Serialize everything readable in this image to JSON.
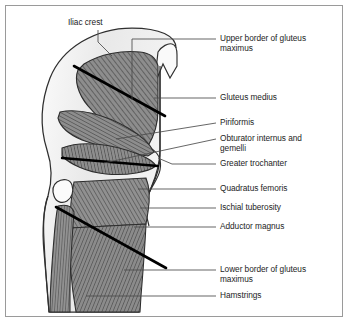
{
  "figure": {
    "type": "anatomical-diagram",
    "view": "posterior view of right hip and thigh",
    "background_color": "#ffffff",
    "border_color": "#9a9a9a",
    "muscle_fill": "#8d8d8d",
    "muscle_hatch": "#3a3a3a",
    "body_fill": "#ececec",
    "outline_color": "#2b2b2b",
    "label_color": "#1d1d1d",
    "leader_color": "#3b3b3b",
    "marker_color": "#000000"
  },
  "labels": {
    "iliac_crest": "Iliac crest",
    "upper_border_gluteus_maximus": "Upper border of gluteus\nmaximus",
    "gluteus_medius": "Gluteus medius",
    "piriformis": "Piriformis",
    "obturator_internus_gemelli": "Obturator internus and\ngemelli",
    "greater_trochanter": "Greater trochanter",
    "quadratus_femoris": "Quadratus femoris",
    "ischial_tuberosity": "Ischial tuberosity",
    "adductor_magnus": "Adductor magnus",
    "lower_border_gluteus_maximus": "Lower border of gluteus\nmaximus",
    "hamstrings": "Hamstrings"
  },
  "structures": [
    {
      "name": "iliac-crest",
      "kind": "bony-landmark",
      "marker": "thick-black-line"
    },
    {
      "name": "upper-border-gluteus-maximus",
      "kind": "muscle-border"
    },
    {
      "name": "gluteus-medius",
      "kind": "muscle",
      "shape": "fan"
    },
    {
      "name": "piriformis",
      "kind": "muscle",
      "shape": "wedge"
    },
    {
      "name": "obturator-internus-and-gemelli",
      "kind": "muscle",
      "shape": "lens"
    },
    {
      "name": "greater-trochanter",
      "kind": "bony-landmark"
    },
    {
      "name": "quadratus-femoris",
      "kind": "muscle",
      "shape": "quadrilateral"
    },
    {
      "name": "ischial-tuberosity",
      "kind": "bony-landmark"
    },
    {
      "name": "adductor-magnus",
      "kind": "muscle"
    },
    {
      "name": "lower-border-gluteus-maximus",
      "kind": "muscle-border",
      "marker": "thick-black-line"
    },
    {
      "name": "hamstrings",
      "kind": "muscle-group"
    }
  ]
}
